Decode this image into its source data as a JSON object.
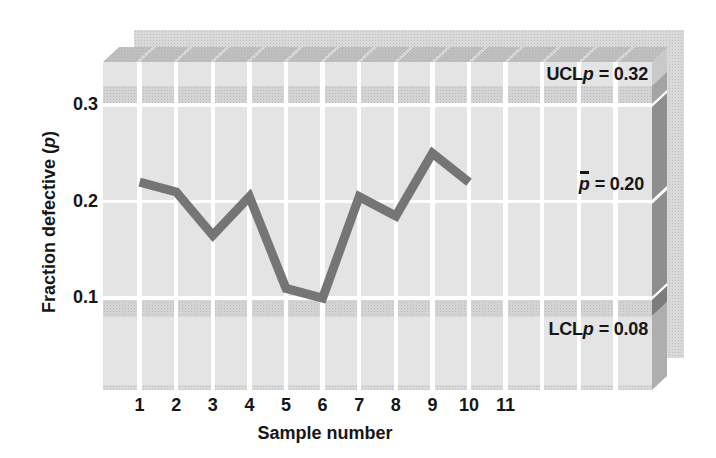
{
  "figure": {
    "y_axis": {
      "title_prefix": "Fraction defective (",
      "title_var": "p",
      "title_suffix": ")",
      "tick_labels": [
        "0.3",
        "0.2",
        "0.1"
      ]
    },
    "x_axis": {
      "title": "Sample number",
      "tick_labels": [
        "1",
        "2",
        "3",
        "4",
        "5",
        "6",
        "7",
        "8",
        "9",
        "10",
        "11"
      ]
    },
    "annotations": {
      "ucl": {
        "prefix": "UCL",
        "var": "p",
        "value": "= 0.32"
      },
      "center": {
        "var": "p",
        "value": "= 0.20"
      },
      "lcl": {
        "prefix": "LCL",
        "var": "p",
        "value": "= 0.08"
      }
    },
    "colors": {
      "plot_face": "#e4e4e4",
      "limit_band": "#d4d4d4",
      "grid_white": "#ffffff",
      "top_face": "#c2c2c2",
      "side_face_dark": "#8e8e8e",
      "back_panel": "#d9d9d9",
      "data_line": "#757575",
      "text": "#161616"
    }
  },
  "chart_data": {
    "type": "line",
    "title": "",
    "xlabel": "Sample number",
    "ylabel": "Fraction defective (p)",
    "x": [
      1,
      2,
      3,
      4,
      5,
      6,
      7,
      8,
      9,
      10
    ],
    "values": [
      0.22,
      0.21,
      0.165,
      0.205,
      0.11,
      0.1,
      0.205,
      0.185,
      0.25,
      0.22
    ],
    "x_ticks": [
      1,
      2,
      3,
      4,
      5,
      6,
      7,
      8,
      9,
      10,
      11
    ],
    "y_ticks": [
      0.3,
      0.2,
      0.1
    ],
    "ucl": 0.32,
    "center_line": 0.2,
    "lcl": 0.08,
    "ylim": [
      0,
      0.345
    ],
    "grid": "white-on-gray",
    "legend": "none",
    "annotations": [
      "UCLp = 0.32",
      "p-bar = 0.20",
      "LCLp = 0.08"
    ]
  }
}
